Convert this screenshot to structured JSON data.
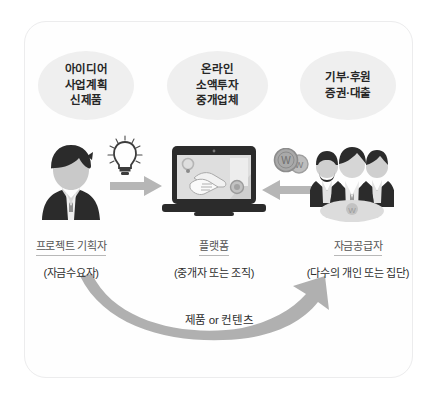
{
  "diagram": {
    "title_present": false,
    "frame": {
      "border_color": "#ececed",
      "background": "#fefefe"
    },
    "palette": {
      "ellipse_fill": "#efefef",
      "arrow_gray": "#b3b3b3",
      "icon_dark": "#2b2b2b",
      "icon_mid": "#9a9a9a",
      "text_dark": "#2e2e2e",
      "text_muted": "#555555"
    },
    "ellipses": [
      {
        "name": "idea-ellipse",
        "lines": [
          "아이디어",
          "사업계획",
          "신제품"
        ]
      },
      {
        "name": "platform-ellipse",
        "lines": [
          "온라인",
          "소액투자",
          "중개업체"
        ]
      },
      {
        "name": "funding-ellipse",
        "lines": [
          "기부·후원",
          "증권·대출"
        ]
      }
    ],
    "roles": [
      {
        "name": "프로젝트 기획자",
        "sub": "(자금수요자)"
      },
      {
        "name": "플랫폼",
        "sub": "(중개자 또는 조직)"
      },
      {
        "name": "자금공급자",
        "sub": "(다수의 개인 또는 집단)"
      }
    ],
    "flow_label": "제품 or 컨텐츠",
    "icons": [
      {
        "name": "person-icon",
        "meaning": "project planner avatar"
      },
      {
        "name": "lightbulb-icon",
        "meaning": "idea"
      },
      {
        "name": "arrow-right-icon",
        "meaning": "idea flows to platform"
      },
      {
        "name": "laptop-icon",
        "meaning": "online platform with handshake"
      },
      {
        "name": "arrow-left-icon",
        "meaning": "funds flow to platform"
      },
      {
        "name": "coins-icon",
        "meaning": "won currency coins"
      },
      {
        "name": "group-icon",
        "meaning": "crowd of funders"
      },
      {
        "name": "curved-arrow-icon",
        "meaning": "product or content returns to funders"
      }
    ]
  }
}
